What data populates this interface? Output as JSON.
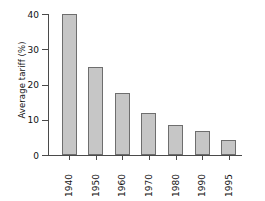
{
  "chart_data": {
    "type": "bar",
    "title": "",
    "xlabel": "",
    "ylabel": "Average tariff (%)",
    "categories": [
      "1940",
      "1950",
      "1960",
      "1970",
      "1980",
      "1990",
      "1995"
    ],
    "values": [
      40,
      25,
      17.5,
      12,
      8.5,
      6.8,
      4.3
    ],
    "ylim": [
      0,
      40
    ],
    "yticks": [
      "0",
      "10",
      "20",
      "30",
      "40"
    ],
    "ytick_values": [
      0,
      10,
      20,
      30,
      40
    ],
    "grid": false,
    "legend": false,
    "legend_position": "none",
    "bar_color": "#c6c6c6",
    "bar_edge_color": "#6e6e6e",
    "axis_color": "#4a4a4a",
    "background": "#ffffff"
  }
}
